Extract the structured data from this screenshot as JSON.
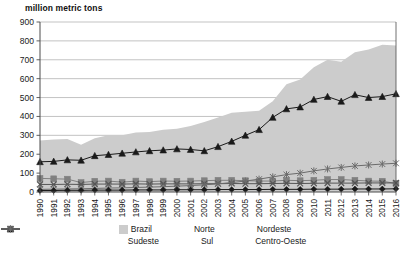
{
  "chart_data": {
    "type": "area",
    "title": "million metric tons",
    "xlabel": "",
    "ylabel": "million metric tons",
    "ylim": [
      0,
      900
    ],
    "ytick_step": 100,
    "yticks": [
      0,
      100,
      200,
      300,
      400,
      500,
      600,
      700,
      800,
      900
    ],
    "grid": true,
    "legend_position": "bottom",
    "categories": [
      "1990",
      "1991",
      "1992",
      "1993",
      "1994",
      "1995",
      "1996",
      "1997",
      "1998",
      "1999",
      "2000",
      "2001",
      "2002",
      "2003",
      "2004",
      "2005",
      "2006",
      "2007",
      "2008",
      "2009",
      "2010",
      "2011",
      "2012",
      "2013",
      "2014",
      "2015",
      "2016"
    ],
    "series": [
      {
        "name": "Brazil",
        "marker": "area",
        "style": "filled-area",
        "color": "#cccccc",
        "values": [
          272,
          278,
          280,
          250,
          285,
          300,
          300,
          315,
          318,
          330,
          335,
          350,
          370,
          395,
          420,
          425,
          430,
          480,
          570,
          595,
          660,
          700,
          690,
          740,
          755,
          780,
          775
        ]
      },
      {
        "name": "Norte",
        "marker": "diamond",
        "color": "#1a1a1a",
        "values": [
          8,
          8,
          9,
          9,
          10,
          10,
          10,
          11,
          11,
          11,
          12,
          12,
          12,
          13,
          13,
          13,
          13,
          14,
          14,
          14,
          15,
          15,
          15,
          16,
          16,
          16,
          17
        ]
      },
      {
        "name": "Nordeste",
        "marker": "square",
        "color": "#808080",
        "values": [
          72,
          70,
          68,
          50,
          57,
          58,
          52,
          58,
          55,
          58,
          57,
          58,
          60,
          62,
          62,
          60,
          58,
          58,
          62,
          60,
          62,
          66,
          66,
          62,
          58,
          57,
          45
        ]
      },
      {
        "name": "Sudeste",
        "marker": "triangle",
        "color": "#1a1a1a",
        "values": [
          160,
          162,
          170,
          168,
          192,
          198,
          205,
          212,
          218,
          222,
          228,
          225,
          218,
          240,
          268,
          300,
          330,
          395,
          440,
          450,
          490,
          505,
          480,
          515,
          500,
          505,
          520
        ]
      },
      {
        "name": "Sul",
        "marker": "x",
        "color": "#555555",
        "values": [
          40,
          40,
          41,
          40,
          42,
          42,
          42,
          43,
          42,
          43,
          43,
          43,
          44,
          44,
          45,
          44,
          44,
          45,
          46,
          45,
          46,
          47,
          47,
          47,
          48,
          48,
          48
        ]
      },
      {
        "name": "Centro-Oeste",
        "marker": "asterisk",
        "color": "#6b6b6b",
        "values": [
          14,
          15,
          16,
          17,
          19,
          21,
          22,
          24,
          26,
          28,
          31,
          34,
          38,
          43,
          50,
          58,
          68,
          80,
          92,
          100,
          112,
          122,
          130,
          138,
          143,
          148,
          152
        ]
      }
    ]
  },
  "legend": {
    "items": [
      {
        "label": "Brazil",
        "marker": "area"
      },
      {
        "label": "Norte",
        "marker": "diamond"
      },
      {
        "label": "Nordeste",
        "marker": "square"
      },
      {
        "label": "Sudeste",
        "marker": "triangle"
      },
      {
        "label": "Sul",
        "marker": "x"
      },
      {
        "label": "Centro-Oeste",
        "marker": "asterisk"
      }
    ]
  },
  "colors": {
    "area": "#cccccc",
    "grid": "#9a9a9a",
    "axis": "#4d4d4d",
    "text": "#1a1a1a"
  }
}
